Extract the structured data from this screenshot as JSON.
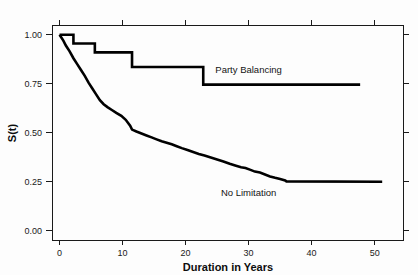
{
  "chart_data": {
    "type": "line",
    "title": "",
    "xlabel": "Duration in Years",
    "ylabel": "S(t)",
    "xlim": [
      -1.2,
      54.5
    ],
    "ylim": [
      -0.05,
      1.05
    ],
    "grid": false,
    "legend_position": "inline-annotation",
    "xticks": [
      0,
      10,
      20,
      30,
      40,
      50
    ],
    "xtick_labels": [
      "0",
      "10",
      "20",
      "30",
      "40",
      "50"
    ],
    "yticks": [
      0.0,
      0.25,
      0.5,
      0.75,
      1.0
    ],
    "ytick_labels": [
      "0.00",
      "0.25",
      "0.50",
      "0.75",
      "1.00"
    ],
    "frame": "box-with-ticks-all-sides",
    "series": [
      {
        "name": "Party Balancing",
        "style": "step-post",
        "label_x": 30,
        "label_y": 0.805,
        "x": [
          0.0,
          2.2,
          2.2,
          5.6,
          5.6,
          11.5,
          11.5,
          22.8,
          22.8,
          47.7
        ],
        "y": [
          1.0,
          1.0,
          0.955,
          0.955,
          0.91,
          0.91,
          0.835,
          0.835,
          0.745,
          0.745
        ]
      },
      {
        "name": "No Limitation",
        "style": "step-post",
        "label_x": 30,
        "label_y": 0.175,
        "x": [
          0.0,
          0.6,
          1.0,
          1.6,
          2.2,
          2.8,
          3.4,
          4.0,
          4.6,
          5.2,
          5.8,
          6.4,
          7.0,
          7.6,
          8.3,
          9.0,
          9.8,
          10.5,
          11.2,
          11.5,
          12.2,
          13.0,
          13.8,
          14.6,
          15.4,
          16.2,
          17.0,
          17.8,
          18.6,
          19.4,
          20.3,
          21.2,
          22.1,
          23.0,
          24.0,
          25.0,
          26.0,
          27.0,
          28.0,
          28.8,
          29.5,
          30.2,
          31.0,
          31.8,
          32.6,
          33.4,
          34.2,
          35.0,
          35.8,
          36.0,
          51.2
        ],
        "y": [
          1.0,
          0.97,
          0.945,
          0.915,
          0.88,
          0.85,
          0.82,
          0.79,
          0.755,
          0.725,
          0.695,
          0.665,
          0.645,
          0.63,
          0.615,
          0.6,
          0.585,
          0.565,
          0.535,
          0.515,
          0.505,
          0.495,
          0.485,
          0.475,
          0.465,
          0.455,
          0.448,
          0.44,
          0.43,
          0.42,
          0.41,
          0.4,
          0.39,
          0.382,
          0.372,
          0.362,
          0.352,
          0.34,
          0.33,
          0.322,
          0.318,
          0.31,
          0.3,
          0.295,
          0.285,
          0.275,
          0.268,
          0.262,
          0.255,
          0.25,
          0.248
        ]
      }
    ]
  },
  "axes": {
    "x_title": "Duration in Years",
    "y_title": "S(t)"
  }
}
